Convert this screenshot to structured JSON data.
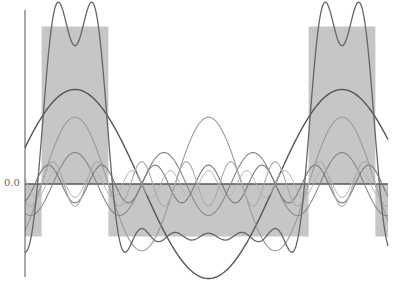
{
  "chart_data": {
    "type": "line",
    "title": "",
    "xlabel": "",
    "ylabel": "",
    "grid": false,
    "legend": null,
    "y_tick_labels": [
      "0.0"
    ],
    "pulse": {
      "high_level": 0.75,
      "low_level": -0.25,
      "duty_cycle": 0.25,
      "period_px": 267,
      "first_pulse_start_px": 42,
      "first_pulse_end_px": 108,
      "second_pulse_start_px": 309,
      "second_pulse_end_px": 373
    },
    "harmonics": [
      {
        "n": 1,
        "amplitude": 0.45,
        "color": "#555555",
        "width": 1.4
      },
      {
        "n": 2,
        "amplitude": 0.318,
        "color": "#9a9a9a",
        "width": 1.1
      },
      {
        "n": 3,
        "amplitude": 0.15,
        "color": "#888888",
        "width": 1.1
      },
      {
        "n": 5,
        "amplitude": -0.09,
        "color": "#7a7a7a",
        "width": 1.1
      },
      {
        "n": 6,
        "amplitude": -0.106,
        "color": "#aaaaaa",
        "width": 1.1
      },
      {
        "n": 7,
        "amplitude": -0.064,
        "color": "#b5b5b5",
        "width": 1.0
      }
    ],
    "partial_sum": {
      "label": "sum of harmonics",
      "color": "#666666",
      "width": 1.3
    },
    "colors": {
      "pulse_fill": "#c6c6c6",
      "axis": "#555555",
      "zero_line": "#555555"
    }
  },
  "axis": {
    "zero_label": "0.0"
  }
}
